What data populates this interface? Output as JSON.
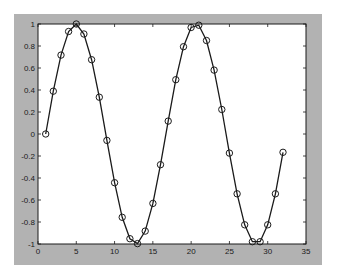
{
  "colors": {
    "figure_bg": "#ffffff",
    "frame_bg": "#b2b2b2",
    "axes_bg": "#ffffff",
    "axis_color": "#1a1a1a",
    "line_color": "#1a1a1a",
    "marker_color": "#1a1a1a"
  },
  "chart_data": {
    "type": "line",
    "title": "",
    "xlabel": "",
    "ylabel": "",
    "xlim": [
      0,
      35
    ],
    "ylim": [
      -1,
      1
    ],
    "grid": false,
    "legend": null,
    "xticks": [
      0,
      5,
      10,
      15,
      20,
      25,
      30,
      35
    ],
    "xtick_labels": [
      "0",
      "5",
      "10",
      "15",
      "20",
      "25",
      "30",
      "35"
    ],
    "yticks": [
      1,
      0.8,
      0.6,
      0.4,
      0.2,
      0,
      -0.2,
      -0.4,
      -0.6,
      -0.8,
      -1
    ],
    "ytick_labels": [
      "1",
      "0.8",
      "0.6",
      "0.4",
      "0.2",
      "0",
      "-0.2",
      "-0.4",
      "-0.6",
      "-0.8",
      "-1"
    ],
    "series": [
      {
        "name": "sin",
        "style": "solid line with circle markers",
        "x": [
          1,
          2,
          3,
          4,
          5,
          6,
          7,
          8,
          9,
          10,
          11,
          12,
          13,
          14,
          15,
          16,
          17,
          18,
          19,
          20,
          21,
          22,
          23,
          24,
          25,
          26,
          27,
          28,
          29,
          30,
          31,
          32
        ],
        "values": [
          0.0,
          0.389,
          0.717,
          0.932,
          1.0,
          0.909,
          0.675,
          0.335,
          -0.058,
          -0.443,
          -0.757,
          -0.952,
          -0.996,
          -0.883,
          -0.631,
          -0.279,
          0.117,
          0.494,
          0.794,
          0.968,
          0.989,
          0.85,
          0.581,
          0.223,
          -0.174,
          -0.544,
          -0.825,
          -0.979,
          -0.979,
          -0.825,
          -0.544,
          -0.166
        ]
      }
    ]
  }
}
